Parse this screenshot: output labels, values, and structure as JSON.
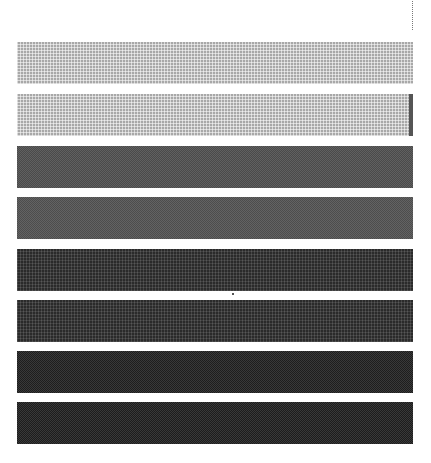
{
  "pattern": {
    "description": "grayscale dither test bars",
    "bars": [
      {
        "index": 1,
        "top": 42,
        "color": "#a8a8a8",
        "texture": "grid"
      },
      {
        "index": 2,
        "top": 94,
        "color": "#a8a8a8",
        "texture": "grid",
        "edge_mark_color": "#555555"
      },
      {
        "index": 3,
        "top": 146,
        "color": "#4a4a4a",
        "texture": "check"
      },
      {
        "index": 4,
        "top": 197,
        "color": "#4d4d4d",
        "texture": "check"
      },
      {
        "index": 5,
        "top": 249,
        "color": "#2a2a2a",
        "texture": "dark-grid"
      },
      {
        "index": 6,
        "top": 300,
        "color": "#2a2a2a",
        "texture": "dark-grid"
      },
      {
        "index": 7,
        "top": 351,
        "color": "#1e1e1e",
        "texture": "check"
      },
      {
        "index": 8,
        "top": 402,
        "color": "#1c1c1c",
        "texture": "check"
      }
    ]
  }
}
